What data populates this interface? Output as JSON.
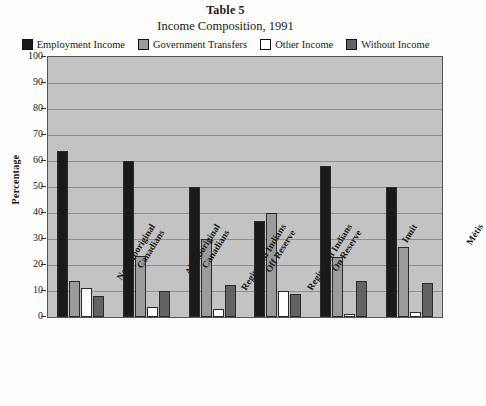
{
  "header": {
    "table_label": "Table 5",
    "chart_title": "Income Composition, 1991"
  },
  "legend": {
    "items": [
      {
        "label": "Employment Income",
        "color": "#1a1a1a",
        "key": "employment"
      },
      {
        "label": "Government Transfers",
        "color": "#9b9b9b",
        "key": "government"
      },
      {
        "label": "Other Income",
        "color": "#ffffff",
        "key": "other"
      },
      {
        "label": "Without Income",
        "color": "#636363",
        "key": "without"
      }
    ]
  },
  "chart_data": {
    "type": "bar",
    "title": "Income Composition, 1991",
    "xlabel": "",
    "ylabel": "Percentage",
    "ylim": [
      0,
      100
    ],
    "ytick_step": 10,
    "yticks": [
      0,
      10,
      20,
      30,
      40,
      50,
      60,
      70,
      80,
      90,
      100
    ],
    "grid": true,
    "legend_position": "top",
    "plot_background": "#c3c3c3",
    "categories": [
      "Non-Aboriginal Canadians",
      "All Aboriginal Canadians",
      "Registered Indians Off Reserve",
      "Registered Indians On Reserve",
      "Inuit",
      "Métis"
    ],
    "categories_lines": [
      [
        "Non-Aboriginal",
        "Canadians"
      ],
      [
        "All Aboriginal",
        "Canadians"
      ],
      [
        "Registered Indians",
        "Off Reserve"
      ],
      [
        "Registered Indians",
        "On Reserve"
      ],
      [
        "Inuit",
        ""
      ],
      [
        "Métis",
        ""
      ]
    ],
    "series": [
      {
        "name": "Employment Income",
        "color": "#1a1a1a",
        "values": [
          64,
          60,
          50,
          37,
          58,
          50
        ]
      },
      {
        "name": "Government Transfers",
        "color": "#9b9b9b",
        "values": [
          14,
          23.5,
          30,
          40,
          23,
          27
        ]
      },
      {
        "name": "Other Income",
        "color": "#ffffff",
        "values": [
          11,
          4,
          3,
          10,
          1,
          2
        ]
      },
      {
        "name": "Without Income",
        "color": "#636363",
        "values": [
          8,
          10,
          12.5,
          9,
          14,
          13
        ]
      }
    ]
  },
  "footnote": {
    "text": ""
  }
}
